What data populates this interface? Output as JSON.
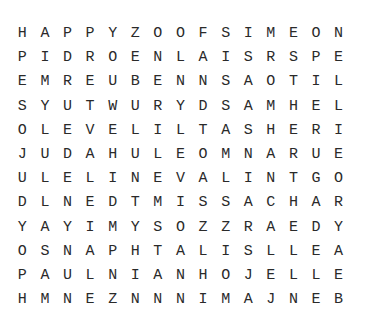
{
  "puzzle": {
    "rows": [
      "HAPPYZOOFSIMEON",
      "PIDROENLAISRSPE",
      "EMREUBENNSAOTIL",
      "SYUTWURYDSAMHEL",
      "OLEVELILTASHERI",
      "JUDAHULEOMNARUE",
      "ULELINEVALINTGO",
      "DLNEDTMISSACHAR",
      "YAYIMYSOZZRAEDY",
      "OSNAPHTALISLLEA",
      "PAULNIANHOJELLE",
      "HMNEZNNNIMAJNEB"
    ]
  }
}
